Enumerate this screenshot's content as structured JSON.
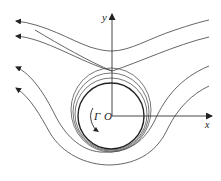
{
  "diagram": {
    "labels": {
      "x_axis": "x",
      "y_axis": "y",
      "origin": "O",
      "circulation": "Γ"
    },
    "colors": {
      "streamline": "#555555",
      "cylinder": "#222222",
      "axis": "#333333"
    },
    "streamline_count_upper": 2,
    "streamline_count_lower": 2,
    "closed_streamlines_around_cylinder": 3,
    "flow_direction": "right-to-left"
  }
}
